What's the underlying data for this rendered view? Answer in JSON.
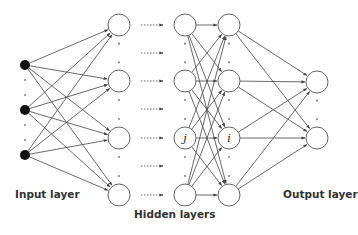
{
  "diagram": {
    "labels": {
      "input": "Input layer",
      "hidden": "Hidden layers",
      "output": "Output layer"
    },
    "node_labels": {
      "j": "j",
      "i": "i"
    },
    "colors": {
      "input_node": "#111111",
      "node_stroke": "#555555",
      "edge": "#444444",
      "dots": "#888888"
    },
    "layers": {
      "input": {
        "x": 25,
        "ys": [
          65,
          110,
          155
        ],
        "r": 5
      },
      "hidden1": {
        "x": 119,
        "ys": [
          25,
          81,
          138,
          195
        ],
        "r": 11
      },
      "hidden2": {
        "x": 185,
        "ys": [
          25,
          81,
          138,
          195
        ],
        "r": 11
      },
      "hidden3": {
        "x": 229,
        "ys": [
          25,
          81,
          138,
          195
        ],
        "r": 11
      },
      "output": {
        "x": 317,
        "ys": [
          82,
          138
        ],
        "r": 11
      }
    },
    "dotted_arrow_ys": [
      25,
      53,
      81,
      109,
      138,
      166,
      195
    ]
  }
}
